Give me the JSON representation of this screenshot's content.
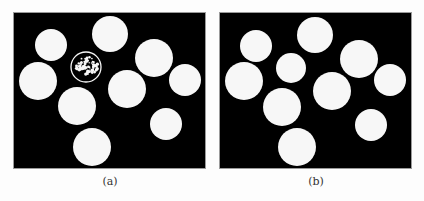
{
  "figure": {
    "panels": [
      {
        "id": "a",
        "caption": "(a)",
        "description": "Binary segmentation with defects",
        "background": "#000000",
        "foreground": "#f7f7f7",
        "circles": [
          {
            "cx": 50,
            "cy": 44,
            "r": 16
          },
          {
            "cx": 109,
            "cy": 33,
            "r": 18
          },
          {
            "cx": 85,
            "cy": 66,
            "r": 15,
            "style": "ring-speckled"
          },
          {
            "cx": 153,
            "cy": 57,
            "r": 19
          },
          {
            "cx": 37,
            "cy": 80,
            "r": 19
          },
          {
            "cx": 184,
            "cy": 79,
            "r": 16
          },
          {
            "cx": 126,
            "cy": 88,
            "r": 19
          },
          {
            "cx": 76,
            "cy": 105,
            "r": 19
          },
          {
            "cx": 165,
            "cy": 123,
            "r": 16
          },
          {
            "cx": 91,
            "cy": 146,
            "r": 19
          }
        ]
      },
      {
        "id": "b",
        "caption": "(b)",
        "description": "Clean binary segmentation",
        "background": "#000000",
        "foreground": "#f7f7f7",
        "circles": [
          {
            "cx": 255,
            "cy": 45,
            "r": 16
          },
          {
            "cx": 314,
            "cy": 34,
            "r": 18
          },
          {
            "cx": 290,
            "cy": 67,
            "r": 15
          },
          {
            "cx": 358,
            "cy": 58,
            "r": 19
          },
          {
            "cx": 243,
            "cy": 80,
            "r": 19
          },
          {
            "cx": 389,
            "cy": 79,
            "r": 16
          },
          {
            "cx": 331,
            "cy": 90,
            "r": 19
          },
          {
            "cx": 281,
            "cy": 106,
            "r": 19
          },
          {
            "cx": 370,
            "cy": 124,
            "r": 16
          },
          {
            "cx": 296,
            "cy": 146,
            "r": 19
          }
        ]
      }
    ]
  }
}
